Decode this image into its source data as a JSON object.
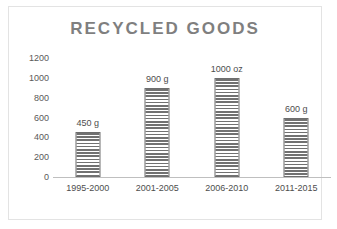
{
  "chart_data": {
    "type": "bar",
    "title": "RECYCLED GOODS",
    "xlabel": "",
    "ylabel": "",
    "categories": [
      "1995-2000",
      "2001-2005",
      "2006-2010",
      "2011-2015"
    ],
    "values": [
      450,
      900,
      1000,
      600
    ],
    "data_labels": [
      "450 g",
      "900 g",
      "1000 oz",
      "600 g"
    ],
    "ylim": [
      0,
      1200
    ],
    "ytick_labels": [
      "1200",
      "1000",
      "800",
      "600",
      "400",
      "200",
      "0"
    ],
    "ytick_values": [
      1200,
      1000,
      800,
      600,
      400,
      200,
      0
    ],
    "grid": false,
    "legend": "none",
    "colors": {
      "title": "#7f7f7f",
      "bar_fill": "#717171",
      "bar_outline": "#6e6e6e",
      "axis_line": "#bfbfbf",
      "tick_text": "#4d4d4d",
      "frame_border": "#e3e3e3",
      "background": "#ffffff"
    }
  }
}
